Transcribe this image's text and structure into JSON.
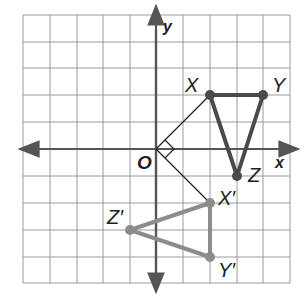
{
  "figure": {
    "type": "coordinate-plane-rotation",
    "grid": {
      "xmin": -5,
      "xmax": 5,
      "ymin": -5,
      "ymax": 5,
      "step": 1
    },
    "axes": {
      "x_label": "x",
      "y_label": "y",
      "origin_label": "O"
    },
    "original_triangle": {
      "color": "#4a4a4a",
      "vertices": [
        {
          "name": "X",
          "x": 2,
          "y": 2
        },
        {
          "name": "Y",
          "x": 4,
          "y": 2
        },
        {
          "name": "Z",
          "x": 3,
          "y": -1
        }
      ]
    },
    "image_triangle": {
      "color": "#8c8c8c",
      "vertices": [
        {
          "name": "X′",
          "x": 2,
          "y": -2
        },
        {
          "name": "Y′",
          "x": 2,
          "y": -4
        },
        {
          "name": "Z′",
          "x": -1,
          "y": -3
        }
      ]
    },
    "rotation_marker": {
      "from": "X",
      "to": "X′",
      "angle": "90°",
      "right_angle_mark": true
    }
  }
}
